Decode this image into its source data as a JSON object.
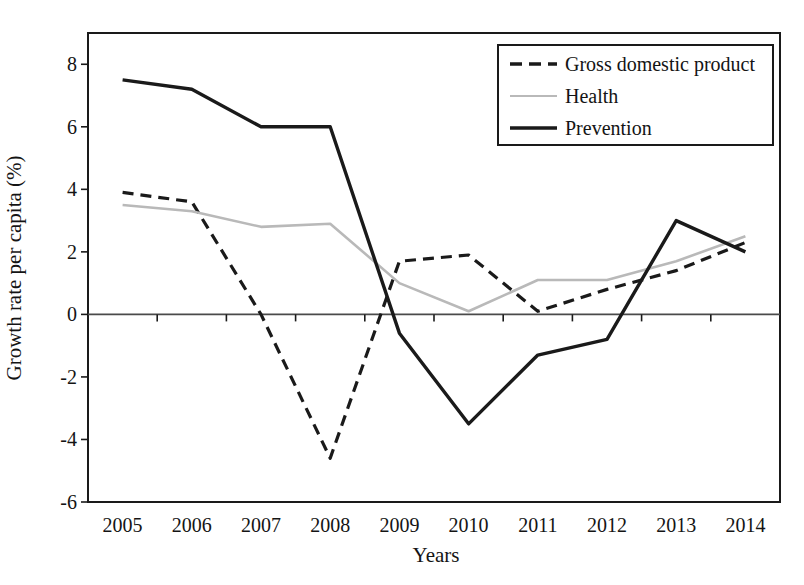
{
  "chart_data": {
    "type": "line",
    "title": "",
    "xlabel": "Years",
    "ylabel": "Growth rate per capita (%)",
    "categories": [
      "2005",
      "2006",
      "2007",
      "2008",
      "2009",
      "2010",
      "2011",
      "2012",
      "2013",
      "2014"
    ],
    "series": [
      {
        "name": "Gross domestic product",
        "style": "dashed",
        "color": "#1a1a1a",
        "values": [
          3.9,
          3.6,
          0.0,
          -4.6,
          1.7,
          1.9,
          0.1,
          0.8,
          1.4,
          2.3
        ]
      },
      {
        "name": "Health",
        "style": "solid",
        "color": "#b9b9b9",
        "values": [
          3.5,
          3.3,
          2.8,
          2.9,
          1.0,
          0.1,
          1.1,
          1.1,
          1.7,
          2.5
        ]
      },
      {
        "name": "Prevention",
        "style": "solid",
        "color": "#1a1a1a",
        "values": [
          7.5,
          7.2,
          6.0,
          6.0,
          -0.6,
          -3.5,
          -1.3,
          -0.8,
          3.0,
          2.0
        ]
      }
    ],
    "ylim": [
      -6,
      9
    ],
    "yticks": [
      8,
      6,
      4,
      2,
      0,
      -2,
      -4,
      -6
    ],
    "grid": false,
    "zero_line": true,
    "legend_position": "top-right",
    "frame_color": "#1a1a1a",
    "zero_line_color": "#4a4a4a",
    "background_color": "#ffffff"
  }
}
